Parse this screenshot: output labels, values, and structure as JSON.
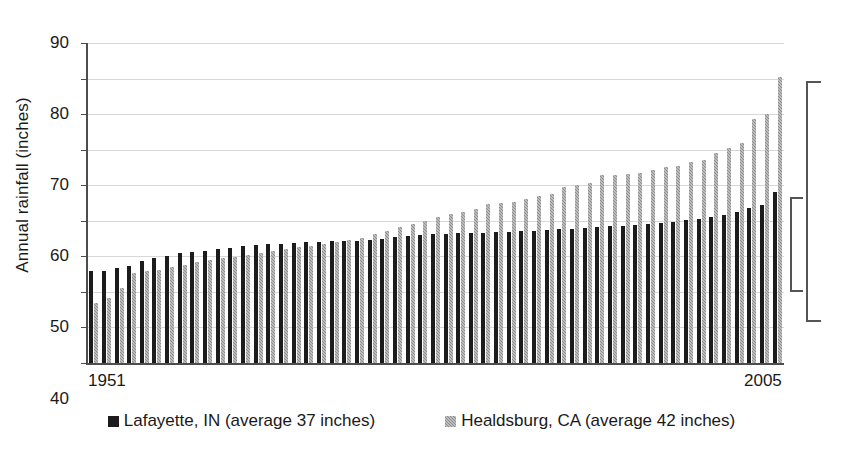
{
  "chart_data": {
    "type": "bar",
    "title": "",
    "xlabel": "",
    "ylabel": "Annual rainfall (inches)",
    "ylim": [
      0,
      90
    ],
    "yticks": [
      0,
      10,
      20,
      30,
      40,
      50,
      60,
      70,
      80,
      90
    ],
    "grid": true,
    "legend_position": "bottom",
    "x_axis_endpoints": [
      "1951",
      "2005"
    ],
    "categories": [
      "1951",
      "1952",
      "1953",
      "1954",
      "1955",
      "1956",
      "1957",
      "1958",
      "1959",
      "1960",
      "1961",
      "1962",
      "1963",
      "1964",
      "1965",
      "1966",
      "1967",
      "1968",
      "1969",
      "1970",
      "1971",
      "1972",
      "1973",
      "1974",
      "1975",
      "1976",
      "1977",
      "1978",
      "1979",
      "1980",
      "1981",
      "1982",
      "1983",
      "1984",
      "1985",
      "1986",
      "1987",
      "1988",
      "1989",
      "1990",
      "1991",
      "1992",
      "1993",
      "1994",
      "1995",
      "1996",
      "1997",
      "1998",
      "1999",
      "2000",
      "2001",
      "2002",
      "2003",
      "2004",
      "2005"
    ],
    "note": "Both series are sorted ascending (rank-ordered), not chronological; the axis endpoints label the span of years covered.",
    "series": [
      {
        "name": "Lafayette, IN (average 37 inches)",
        "color": "#1c1c1c",
        "average": 37,
        "values": [
          25.8,
          25.8,
          26.6,
          27.3,
          28.6,
          29.6,
          30.2,
          30.9,
          31.3,
          31.6,
          32.0,
          32.4,
          32.8,
          33.1,
          33.4,
          33.6,
          33.8,
          34.0,
          34.1,
          34.2,
          34.3,
          34.4,
          34.6,
          34.9,
          35.4,
          35.8,
          36.0,
          36.2,
          36.4,
          36.5,
          36.6,
          36.7,
          36.8,
          36.9,
          37.0,
          37.2,
          37.4,
          37.6,
          37.8,
          38.0,
          38.2,
          38.4,
          38.6,
          38.9,
          39.2,
          39.5,
          39.8,
          40.1,
          40.5,
          41.0,
          41.6,
          42.5,
          43.5,
          44.5,
          48.0
        ]
      },
      {
        "name": "Healdsburg, CA (average 42 inches)",
        "color": "#8f8f8f",
        "average": 42,
        "values": [
          16.8,
          18.2,
          21.1,
          25.2,
          25.9,
          26.3,
          26.9,
          27.7,
          28.3,
          29.0,
          29.4,
          29.8,
          30.3,
          30.9,
          31.4,
          32.0,
          32.5,
          33.0,
          33.5,
          34.0,
          34.6,
          35.3,
          36.2,
          37.2,
          38.2,
          39.1,
          40.0,
          41.0,
          41.8,
          42.6,
          43.2,
          44.8,
          45.0,
          45.3,
          46.1,
          47.0,
          47.6,
          49.5,
          50.0,
          50.5,
          52.8,
          53.0,
          53.2,
          53.5,
          54.2,
          55.0,
          55.4,
          56.4,
          57.2,
          59.2,
          60.6,
          62.0,
          68.5,
          70.0,
          80.5
        ]
      }
    ],
    "annotations": [
      {
        "name": "healdsburg-range-bracket",
        "description": "Tall bracket on right edge spanning the Healdsburg, CA range",
        "value_top": 80.5,
        "value_bottom": 14.0
      },
      {
        "name": "lafayette-range-bracket",
        "description": "Short bracket on right edge spanning the Lafayette, IN range",
        "value_top": 48.0,
        "value_bottom": 22.5
      }
    ]
  },
  "legend": {
    "entries": [
      {
        "label": "Lafayette, IN (average 37 inches)"
      },
      {
        "label": "Healdsburg, CA (average 42 inches)"
      }
    ]
  }
}
